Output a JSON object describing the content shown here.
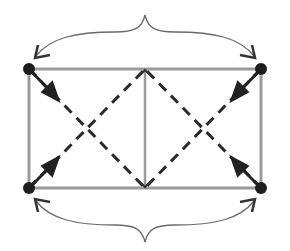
{
  "diagram": {
    "colors": {
      "background": "#ffffff",
      "frame": "#9a9a9a",
      "dashed": "#2a2a2a",
      "node": "#1e1e1e",
      "arrow": "#222222",
      "curve": "#6a6a6a"
    },
    "nodes": [
      {
        "id": "top-left",
        "x": 29,
        "y": 69
      },
      {
        "id": "top-right",
        "x": 261,
        "y": 69
      },
      {
        "id": "bottom-left",
        "x": 29,
        "y": 188
      },
      {
        "id": "bottom-right",
        "x": 261,
        "y": 188
      }
    ],
    "frame": {
      "x1": 29,
      "y1": 69,
      "x2": 261,
      "y2": 188,
      "divider_x": 145
    },
    "curves": [
      {
        "id": "top-curve",
        "from": "top-right",
        "to": "top-left",
        "peak": [
          145,
          15
        ]
      },
      {
        "id": "bottom-curve",
        "from": "bottom-left",
        "to": "bottom-right",
        "peak": [
          145,
          242
        ]
      }
    ],
    "labels": []
  }
}
